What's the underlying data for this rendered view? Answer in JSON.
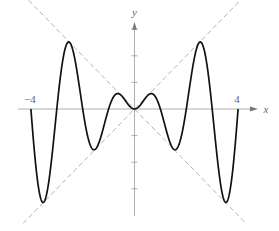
{
  "chart_data": {
    "type": "line",
    "title": "",
    "function": "y = x sin(pi x)",
    "xlabel": "x",
    "ylabel": "y",
    "xlim": [
      -4,
      4
    ],
    "ylim": [
      -4,
      4
    ],
    "x_tick_labels": [
      "-4",
      "4"
    ],
    "y_ticks": [
      -3,
      -2,
      -1,
      1,
      2,
      3
    ],
    "grid": false,
    "series": [
      {
        "name": "y = x sin(pi x)",
        "style": "solid",
        "color": "#111111",
        "x": [
          -4,
          -3.5,
          -3,
          -2.5,
          -2,
          -1.5,
          -1,
          -0.5,
          0,
          0.5,
          1,
          1.5,
          2,
          2.5,
          3,
          3.5,
          4
        ],
        "y": [
          0,
          -3.5,
          0,
          2.5,
          0,
          -1.5,
          0,
          0.5,
          0,
          0.5,
          0,
          -1.5,
          0,
          2.5,
          0,
          -3.5,
          0
        ]
      },
      {
        "name": "y = x",
        "style": "dashed",
        "color": "#aaaaaa",
        "x": [
          -4.3,
          4.3
        ],
        "y": [
          -4.3,
          4.3
        ]
      },
      {
        "name": "y = -x",
        "style": "dashed",
        "color": "#aaaaaa",
        "x": [
          -4.3,
          4.3
        ],
        "y": [
          4.3,
          -4.3
        ]
      }
    ]
  },
  "labels": {
    "x_axis": "x",
    "y_axis": "y",
    "x_min": "−4",
    "x_max": "4"
  }
}
